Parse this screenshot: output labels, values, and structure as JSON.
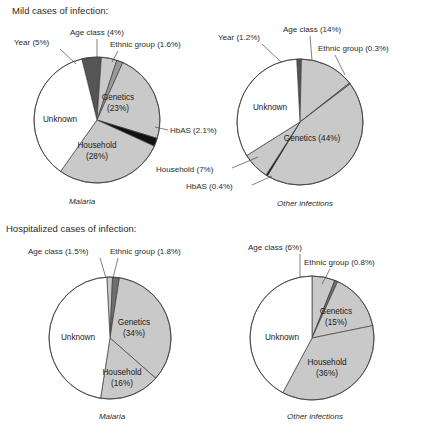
{
  "figure": {
    "sections": [
      {
        "id": "mild",
        "title": "Mild cases of infection:"
      },
      {
        "id": "hospitalized",
        "title": "Hospitalized cases of infection:"
      }
    ]
  },
  "colors": {
    "light_gray": "#c9c9c9",
    "mid_gray": "#9a9a9a",
    "dark_gray": "#555555",
    "black": "#111111",
    "white": "#ffffff",
    "outline": "#3d3d3d",
    "text": "#2b2b2b"
  },
  "chart_data": [
    {
      "id": "mild-malaria",
      "type": "pie",
      "title": "Mild cases of infection:",
      "caption": "Malaria",
      "categories": [
        "Year",
        "Age class",
        "Ethnic group",
        "Genetics",
        "HbAS",
        "Household",
        "Unknown"
      ],
      "values": [
        5,
        4,
        1.6,
        23,
        2.1,
        28,
        36.3
      ],
      "labels": [
        "Year (5%)",
        "Age class (4%)",
        "Ethnic group (1.6%)",
        "Genetics (23%)",
        "HbAS (2.1%)",
        "Household (28%)",
        "Unknown"
      ],
      "fills": [
        "#555555",
        "#c9c9c9",
        "#9a9a9a",
        "#c9c9c9",
        "#111111",
        "#c9c9c9",
        "#ffffff"
      ],
      "start_angle": -14
    },
    {
      "id": "mild-other",
      "type": "pie",
      "title": "Mild cases of infection:",
      "caption": "Other infections",
      "categories": [
        "Year",
        "Age class",
        "Ethnic group",
        "Genetics",
        "HbAS",
        "Household",
        "Unknown"
      ],
      "values": [
        1.2,
        14,
        0.3,
        44,
        0.4,
        7,
        33.1
      ],
      "labels": [
        "Year (1.2%)",
        "Age class (14%)",
        "Ethnic group (0.3%)",
        "Genetics (44%)",
        "HbAS (0.4%)",
        "Household (7%)",
        "Unknown"
      ],
      "fills": [
        "#555555",
        "#c9c9c9",
        "#9a9a9a",
        "#c9c9c9",
        "#111111",
        "#c9c9c9",
        "#ffffff"
      ],
      "start_angle": -3
    },
    {
      "id": "hosp-malaria",
      "type": "pie",
      "title": "Hospitalized cases of infection:",
      "caption": "Malaria",
      "categories": [
        "Age class",
        "Ethnic group",
        "Genetics",
        "Household",
        "Unknown"
      ],
      "values": [
        1.5,
        1.8,
        34,
        16,
        46.7
      ],
      "labels": [
        "Age class (1.5%)",
        "Ethnic group (1.8%)",
        "Genetics (34%)",
        "Household (16%)",
        "Unknown"
      ],
      "fills": [
        "#c9c9c9",
        "#6f6f6f",
        "#c9c9c9",
        "#c9c9c9",
        "#ffffff"
      ],
      "start_angle": -3
    },
    {
      "id": "hosp-other",
      "type": "pie",
      "title": "Hospitalized cases of infection:",
      "caption": "Other infections",
      "categories": [
        "Age class",
        "Ethnic group",
        "Genetics",
        "Household",
        "Unknown"
      ],
      "values": [
        6,
        0.8,
        15,
        36,
        42.2
      ],
      "labels": [
        "Age class (6%)",
        "Ethnic group (0.8%)",
        "Genetics (15%)",
        "Household (36%)",
        "Unknown"
      ],
      "fills": [
        "#c9c9c9",
        "#6f6f6f",
        "#c9c9c9",
        "#c9c9c9",
        "#ffffff"
      ],
      "start_angle": 0
    }
  ],
  "layout": {
    "pies": [
      {
        "id": "mild-malaria",
        "cx": 97,
        "cy": 120,
        "r": 63
      },
      {
        "id": "mild-other",
        "cx": 300,
        "cy": 122,
        "r": 63
      },
      {
        "id": "hosp-malaria",
        "cx": 110,
        "cy": 338,
        "r": 61
      },
      {
        "id": "hosp-other",
        "cx": 312,
        "cy": 338,
        "r": 62
      }
    ],
    "titles": [
      {
        "id": "mild",
        "x": 12,
        "y": 14
      },
      {
        "id": "hospitalized",
        "x": 6,
        "y": 232
      }
    ],
    "captions": [
      {
        "id": "mild-malaria",
        "x": 82,
        "y": 204,
        "anchor": "middle"
      },
      {
        "id": "mild-other",
        "x": 305,
        "y": 206,
        "anchor": "middle"
      },
      {
        "id": "hosp-malaria",
        "x": 112,
        "y": 419,
        "anchor": "middle"
      },
      {
        "id": "hosp-other",
        "x": 315,
        "y": 419,
        "anchor": "middle"
      }
    ],
    "callouts": [
      {
        "pie": "mild-malaria",
        "key": "year",
        "tx": 14,
        "ty": 45,
        "anchor": "start",
        "line": [
          [
            60,
            49
          ],
          [
            76,
            64
          ]
        ]
      },
      {
        "pie": "mild-malaria",
        "key": "age",
        "tx": 70,
        "ty": 35,
        "anchor": "start",
        "line": [
          [
            97,
            39
          ],
          [
            97,
            58
          ]
        ]
      },
      {
        "pie": "mild-malaria",
        "key": "ethnic",
        "tx": 110,
        "ty": 47,
        "anchor": "start",
        "line": [
          [
            118,
            51
          ],
          [
            112,
            62
          ]
        ]
      },
      {
        "pie": "mild-malaria",
        "key": "hbas",
        "tx": 170,
        "ty": 133,
        "anchor": "start",
        "line": [
          [
            168,
            130
          ],
          [
            155,
            127
          ]
        ]
      },
      {
        "pie": "mild-other",
        "key": "year",
        "tx": 218,
        "ty": 40,
        "anchor": "start",
        "line": [
          [
            262,
            44
          ],
          [
            281,
            62
          ]
        ]
      },
      {
        "pie": "mild-other",
        "key": "age",
        "tx": 283,
        "ty": 32,
        "anchor": "start",
        "line": [
          [
            310,
            36
          ],
          [
            312,
            60
          ]
        ]
      },
      {
        "pie": "mild-other",
        "key": "ethnic",
        "tx": 318,
        "ty": 51,
        "anchor": "start",
        "line": [
          [
            335,
            55
          ],
          [
            345,
            75
          ]
        ]
      },
      {
        "pie": "mild-other",
        "key": "household",
        "tx": 156,
        "ty": 172,
        "anchor": "start",
        "line": [
          [
            232,
            168
          ],
          [
            258,
            157
          ]
        ]
      },
      {
        "pie": "mild-other",
        "key": "hbas",
        "tx": 186,
        "ty": 189,
        "anchor": "start",
        "line": [
          [
            252,
            185
          ],
          [
            272,
            176
          ]
        ]
      },
      {
        "pie": "hosp-malaria",
        "key": "age",
        "tx": 28,
        "ty": 254,
        "anchor": "start",
        "line": [
          [
            100,
            258
          ],
          [
            106,
            278
          ]
        ]
      },
      {
        "pie": "hosp-malaria",
        "key": "ethnic",
        "tx": 110,
        "ty": 254,
        "anchor": "start",
        "line": [
          [
            118,
            258
          ],
          [
            113,
            278
          ]
        ]
      },
      {
        "pie": "hosp-other",
        "key": "age",
        "tx": 248,
        "ty": 250,
        "anchor": "start",
        "line": [
          [
            300,
            254
          ],
          [
            300,
            278
          ]
        ]
      },
      {
        "pie": "hosp-other",
        "key": "ethnic",
        "tx": 304,
        "ty": 265,
        "anchor": "start",
        "line": [
          [
            330,
            269
          ],
          [
            322,
            284
          ]
        ]
      }
    ],
    "inner_labels": [
      {
        "pie": "mild-malaria",
        "key": "genetics",
        "x": 118,
        "y": 100,
        "anchor": "middle",
        "lines": [
          "Genetics",
          "(23%)"
        ]
      },
      {
        "pie": "mild-malaria",
        "key": "household",
        "x": 97,
        "y": 148,
        "anchor": "middle",
        "lines": [
          "Household",
          "(28%)"
        ]
      },
      {
        "pie": "mild-malaria",
        "key": "unknown",
        "x": 60,
        "y": 122,
        "anchor": "middle",
        "lines": [
          "Unknown"
        ]
      },
      {
        "pie": "mild-other",
        "key": "genetics",
        "x": 312,
        "y": 141,
        "anchor": "middle",
        "lines": [
          "Genetics (44%)"
        ]
      },
      {
        "pie": "mild-other",
        "key": "unknown",
        "x": 270,
        "y": 110,
        "anchor": "middle",
        "lines": [
          "Unknown"
        ]
      },
      {
        "pie": "hosp-malaria",
        "key": "genetics",
        "x": 134,
        "y": 325,
        "anchor": "middle",
        "lines": [
          "Genetics",
          "(34%)"
        ]
      },
      {
        "pie": "hosp-malaria",
        "key": "household",
        "x": 122,
        "y": 375,
        "anchor": "middle",
        "lines": [
          "Household",
          "(16%)"
        ]
      },
      {
        "pie": "hosp-malaria",
        "key": "unknown",
        "x": 78,
        "y": 340,
        "anchor": "middle",
        "lines": [
          "Unknown"
        ]
      },
      {
        "pie": "hosp-other",
        "key": "genetics",
        "x": 336,
        "y": 314,
        "anchor": "middle",
        "lines": [
          "Genetics",
          "(15%)"
        ]
      },
      {
        "pie": "hosp-other",
        "key": "household",
        "x": 327,
        "y": 365,
        "anchor": "middle",
        "lines": [
          "Household",
          "(36%)"
        ]
      },
      {
        "pie": "hosp-other",
        "key": "unknown",
        "x": 282,
        "y": 340,
        "anchor": "middle",
        "lines": [
          "Unknown"
        ]
      }
    ]
  },
  "callout_text": {
    "mild-malaria": {
      "year": "Year (5%)",
      "age": "Age class (4%)",
      "ethnic": "Ethnic group (1.6%)",
      "hbas": "HbAS (2.1%)"
    },
    "mild-other": {
      "year": "Year (1.2%)",
      "age": "Age class (14%)",
      "ethnic": "Ethnic group (0.3%)",
      "household": "Household (7%)",
      "hbas": "HbAS (0.4%)"
    },
    "hosp-malaria": {
      "age": "Age class (1.5%)",
      "ethnic": "Ethnic group (1.8%)"
    },
    "hosp-other": {
      "age": "Age class (6%)",
      "ethnic": "Ethnic group (0.8%)"
    }
  }
}
